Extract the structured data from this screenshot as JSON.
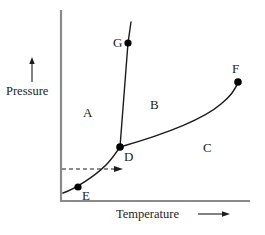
{
  "figure": {
    "type": "phase-diagram",
    "background_color": "#ffffff",
    "axis_color": "#8a8a8a",
    "curve_color": "#1a1a1a",
    "point_color": "#000000"
  },
  "axes": {
    "y": {
      "label": "Pressure",
      "arrow_direction": "up",
      "line": {
        "x": 61,
        "y_top": 10,
        "y_bottom": 201
      }
    },
    "x": {
      "label": "Temperature",
      "arrow_direction": "right",
      "line": {
        "y": 201,
        "x_left": 61,
        "x_right": 250
      }
    }
  },
  "points": [
    {
      "id": "G",
      "label": "G",
      "x": 128,
      "y": 43,
      "label_x": 113,
      "label_y": 36
    },
    {
      "id": "F",
      "label": "F",
      "x": 238,
      "y": 82,
      "label_x": 232,
      "label_y": 62
    },
    {
      "id": "D",
      "label": "D",
      "x": 120,
      "y": 147,
      "label_x": 124,
      "label_y": 150
    },
    {
      "id": "E",
      "label": "E",
      "x": 78,
      "y": 187,
      "label_x": 82,
      "label_y": 189
    }
  ],
  "regions": [
    {
      "id": "A",
      "label": "A",
      "x": 83,
      "y": 106
    },
    {
      "id": "B",
      "label": "B",
      "x": 150,
      "y": 98
    },
    {
      "id": "C",
      "label": "C",
      "x": 203,
      "y": 141
    }
  ],
  "curves": [
    {
      "id": "fusion-curve",
      "name": "fusion-curve-D-to-G",
      "path": "M 120 147 L 128 43 L 131 22"
    },
    {
      "id": "vaporization-curve",
      "name": "vaporization-curve-D-to-F",
      "path": "M 120 147 C 155 137, 200 122, 221 104 C 231 96, 236 88, 238 82"
    },
    {
      "id": "sublimation-curve",
      "name": "sublimation-curve-E-to-D",
      "path": "M 63 193 C 75 189, 95 176, 106 165 C 113 158, 117 151, 120 147"
    }
  ],
  "annotations": [
    {
      "id": "dashed-arrow",
      "name": "dashed-process-arrow",
      "style": "dashed",
      "x_start": 62,
      "x_end": 122,
      "y": 169
    }
  ]
}
